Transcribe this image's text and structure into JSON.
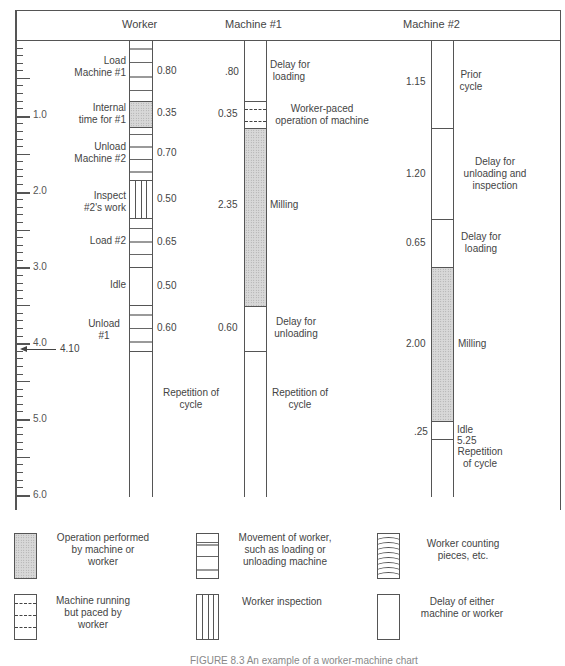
{
  "figure": {
    "caption": "FIGURE 8.3  An example of a worker-machine chart",
    "columns": {
      "worker": "Worker",
      "machine1": "Machine #1",
      "machine2": "Machine #2"
    },
    "time_axis": {
      "labels": [
        "1.0",
        "2.0",
        "3.0",
        "4.0",
        "5.0",
        "6.0"
      ],
      "marker_value": "4.10",
      "range": [
        0,
        6.0
      ],
      "minor_step": 0.1
    },
    "worker": {
      "activities": [
        {
          "label_line1": "Load",
          "label_line2": "Machine #1",
          "time": "0.80",
          "type": "movement"
        },
        {
          "label_line1": "Internal",
          "label_line2": "time for #1",
          "time": "0.35",
          "type": "operation"
        },
        {
          "label_line1": "Unload",
          "label_line2": "Machine #2",
          "time": "0.70",
          "type": "movement"
        },
        {
          "label_line1": "Inspect",
          "label_line2": "#2's work",
          "time": "0.50",
          "type": "inspection"
        },
        {
          "label_line1": "Load #2",
          "label_line2": "",
          "time": "0.65",
          "type": "movement"
        },
        {
          "label_line1": "Idle",
          "label_line2": "",
          "time": "0.50",
          "type": "delay"
        },
        {
          "label_line1": "Unload",
          "label_line2": "#1",
          "time": "0.60",
          "type": "movement"
        }
      ],
      "repetition_line1": "Repetition of",
      "repetition_line2": "cycle"
    },
    "machine1": {
      "activities": [
        {
          "time": ".80",
          "label_line1": "Delay for",
          "label_line2": "loading",
          "type": "delay"
        },
        {
          "time": "0.35",
          "label_line1": "Worker-paced",
          "label_line2": "operation of machine",
          "type": "paced"
        },
        {
          "time": "2.35",
          "label_line1": "Milling",
          "label_line2": "",
          "type": "operation"
        },
        {
          "time": "0.60",
          "label_line1": "Delay for",
          "label_line2": "unloading",
          "type": "delay"
        }
      ],
      "repetition_line1": "Repetition of",
      "repetition_line2": "cycle"
    },
    "machine2": {
      "activities": [
        {
          "time": "1.15",
          "label_line1": "Prior",
          "label_line2": "cycle",
          "label_line3": "",
          "type": "delay"
        },
        {
          "time": "1.20",
          "label_line1": "Delay for",
          "label_line2": "unloading and",
          "label_line3": "inspection",
          "type": "delay"
        },
        {
          "time": "0.65",
          "label_line1": "Delay for",
          "label_line2": "loading",
          "label_line3": "",
          "type": "delay"
        },
        {
          "time": "2.00",
          "label_line1": "Milling",
          "label_line2": "",
          "label_line3": "",
          "type": "operation"
        },
        {
          "time": ".25",
          "label_line1": "Idle",
          "label_line2": "",
          "label_line3": "",
          "type": "delay"
        }
      ],
      "end_value": "5.25",
      "repetition_line1": "Repetition",
      "repetition_line2": "of cycle"
    },
    "legend": [
      {
        "key": "operation",
        "line1": "Operation performed",
        "line2": "by machine or",
        "line3": "worker"
      },
      {
        "key": "movement",
        "line1": "Movement of worker,",
        "line2": "such as loading or",
        "line3": "unloading machine"
      },
      {
        "key": "counting",
        "line1": "Worker counting",
        "line2": "pieces, etc.",
        "line3": ""
      },
      {
        "key": "paced",
        "line1": "Machine running",
        "line2": "but paced by",
        "line3": "worker"
      },
      {
        "key": "inspection",
        "line1": "Worker inspection",
        "line2": "",
        "line3": ""
      },
      {
        "key": "delay",
        "line1": "Delay of either",
        "line2": "machine or worker",
        "line3": ""
      }
    ]
  }
}
